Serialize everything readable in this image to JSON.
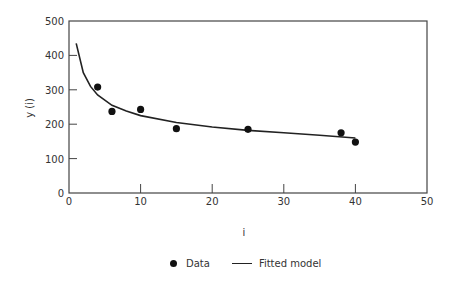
{
  "chart_data": {
    "type": "scatter",
    "title": "",
    "xlabel": "i",
    "ylabel": "y (i)",
    "xlim": [
      0,
      50
    ],
    "ylim": [
      0,
      500
    ],
    "xticks": [
      0,
      10,
      20,
      30,
      40,
      50
    ],
    "yticks": [
      0,
      100,
      200,
      300,
      400,
      500
    ],
    "grid": false,
    "legend_position": "bottom",
    "series": [
      {
        "name": "Data",
        "type": "scatter",
        "x": [
          4,
          6,
          10,
          15,
          25,
          38,
          40
        ],
        "y": [
          308,
          237,
          243,
          187,
          185,
          175,
          148
        ]
      },
      {
        "name": "Fitted model",
        "type": "line",
        "x": [
          1,
          2,
          3,
          4,
          6,
          8,
          10,
          15,
          20,
          25,
          30,
          35,
          40
        ],
        "y": [
          435,
          350,
          310,
          285,
          255,
          238,
          225,
          205,
          192,
          182,
          175,
          168,
          160
        ]
      }
    ]
  },
  "legend": {
    "data_label": "Data",
    "fit_label": "Fitted model"
  },
  "axes": {
    "xlabel": "i",
    "ylabel": "y (i)",
    "xtick_labels": [
      "0",
      "10",
      "20",
      "30",
      "40",
      "50"
    ],
    "ytick_labels": [
      "0",
      "100",
      "200",
      "300",
      "400",
      "500"
    ]
  }
}
